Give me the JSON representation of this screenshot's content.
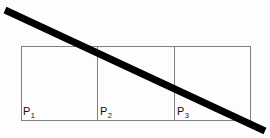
{
  "figure": {
    "type": "geometry-diagram",
    "background_color": "#fdfdfd",
    "canvas": {
      "width": 270,
      "height": 138
    }
  },
  "rectangle": {
    "name": "outer-rectangle",
    "stroke_color": "#808080",
    "stroke_width": 1,
    "fill": "none",
    "x": 21,
    "y": 46,
    "width": 230,
    "height": 75
  },
  "dividers": [
    {
      "name": "divider-1",
      "x": 97,
      "y1": 46,
      "y2": 121,
      "stroke_color": "#808080",
      "stroke_width": 1
    },
    {
      "name": "divider-2",
      "x": 174,
      "y1": 46,
      "y2": 121,
      "stroke_color": "#808080",
      "stroke_width": 1
    }
  ],
  "diagonal": {
    "name": "diagonal-line",
    "stroke_color": "#000000",
    "stroke_width": 7,
    "x1": 5,
    "y1": 10,
    "x2": 265,
    "y2": 131
  },
  "cells": [
    {
      "id": "p1",
      "label": "P",
      "subscript": "1",
      "label_full": "P1"
    },
    {
      "id": "p2",
      "label": "P",
      "subscript": "2",
      "label_full": "P2"
    },
    {
      "id": "p3",
      "label": "P",
      "subscript": "3",
      "label_full": "P3"
    }
  ]
}
